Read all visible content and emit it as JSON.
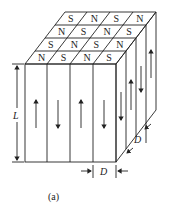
{
  "figure": {
    "caption": "(a)",
    "top_face_rows": [
      [
        "S",
        "N",
        "S",
        "N"
      ],
      [
        "N",
        "S",
        "N",
        "S"
      ],
      [
        "S",
        "N",
        "S",
        "N"
      ],
      [
        "N",
        "S",
        "N",
        "S"
      ]
    ],
    "front_arrows": [
      "up",
      "down",
      "up",
      "down"
    ],
    "side_arrows": [
      "down",
      "up",
      "down",
      "up"
    ],
    "dimension_labels": {
      "height": "L",
      "width": "D",
      "depth": "D"
    }
  }
}
